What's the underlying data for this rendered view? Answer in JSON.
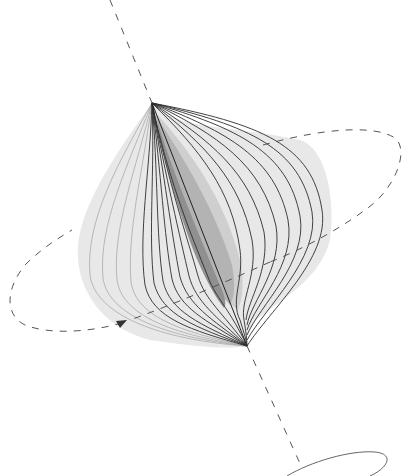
{
  "diagram": {
    "colors": {
      "background": "#ffffff",
      "axis": "#555555",
      "orbit": "#555555",
      "flow_line": "#333333",
      "faint_line": "#9a9a9a",
      "shade_outer": "#e6e6e6",
      "shade_mid": "#c8c8c8",
      "shade_inner": "#a9a9a9",
      "shade_core": "#8c8c8c",
      "small_ellipse": "#666666"
    },
    "axis": {
      "style": "dashed",
      "top": [
        110,
        0
      ],
      "upper_node": [
        152,
        103
      ],
      "lower_node": [
        247,
        345
      ],
      "bottom": [
        302,
        468
      ]
    },
    "orbit": {
      "style": "dashed",
      "direction_arrow": "left-to-right",
      "arrow_pos": [
        122,
        325
      ]
    },
    "flow_line_count": 18,
    "small_ellipse": {
      "center": [
        356,
        462
      ],
      "rx": 62,
      "ry": 14
    }
  }
}
